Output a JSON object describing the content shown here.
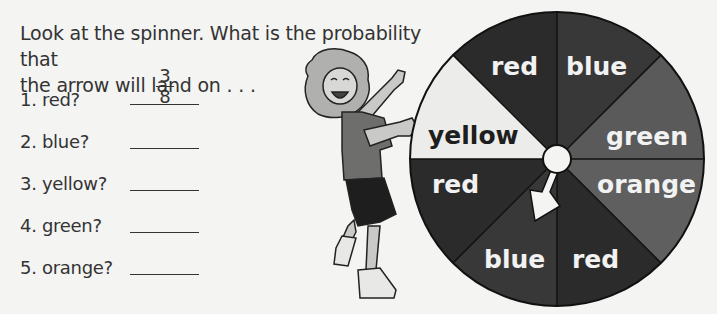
{
  "worksheet": {
    "instructions": "Look at the spinner. What is the probability that the arrow will land on . . .",
    "instructions_line1": "Look at the spinner. What is the probability that",
    "instructions_line2": "the arrow will land on . . .",
    "questions": [
      {
        "number": "1.",
        "label": "1. red?",
        "answer_numerator": "3",
        "answer_denominator": "8",
        "answered": true
      },
      {
        "number": "2.",
        "label": "2. blue?",
        "answer": ""
      },
      {
        "number": "3.",
        "label": "3. yellow?",
        "answer": ""
      },
      {
        "number": "4.",
        "label": "4. green?",
        "answer": ""
      },
      {
        "number": "5.",
        "label": "5. orange?",
        "answer": ""
      }
    ]
  },
  "spinner": {
    "segment_count": 8,
    "segments": [
      {
        "label": "red",
        "position": "top-left",
        "shade": "#2b2b2b"
      },
      {
        "label": "blue",
        "position": "top-right",
        "shade": "#383838"
      },
      {
        "label": "green",
        "position": "right-upper",
        "shade": "#5a5a5a"
      },
      {
        "label": "orange",
        "position": "right-lower",
        "shade": "#5f5f5f"
      },
      {
        "label": "red",
        "position": "bottom-right",
        "shade": "#2b2b2b"
      },
      {
        "label": "blue",
        "position": "bottom-left",
        "shade": "#383838"
      },
      {
        "label": "red",
        "position": "left-lower",
        "shade": "#2b2b2b"
      },
      {
        "label": "yellow",
        "position": "left-upper",
        "shade": "#ececea"
      }
    ],
    "arrow_points_to": "blue"
  },
  "illustration": {
    "subject": "cartoon girl holding spinner"
  }
}
